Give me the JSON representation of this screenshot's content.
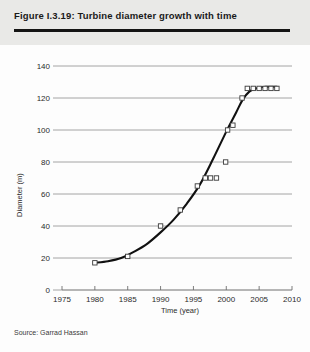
{
  "figure": {
    "title": "Figure I.3.19: Turbine diameter growth with time",
    "source": "Source: Garrad Hassan"
  },
  "colors": {
    "header_background": "#e9e9e7",
    "title_rule": "#141414",
    "gridline": "#8d8d8d",
    "axis": "#6f6f6f",
    "curve": "#111111",
    "marker_stroke": "#3a3a3a",
    "marker_fill": "#ffffff",
    "page_background": "#fdfdfd",
    "text": "#2b2b2b"
  },
  "chart_data": {
    "type": "scatter",
    "title": "Turbine diameter growth with time",
    "xlabel": "Time (year)",
    "ylabel": "Diameter (m)",
    "xlim": [
      1975,
      2010
    ],
    "ylim": [
      0,
      140
    ],
    "xticks": [
      1975,
      1980,
      1985,
      1990,
      1995,
      2000,
      2005,
      2010
    ],
    "yticks": [
      0,
      20,
      40,
      60,
      80,
      100,
      120,
      140
    ],
    "xtick_labels": [
      "1975",
      "1980",
      "1985",
      "1990",
      "1995",
      "2000",
      "2005",
      "2010"
    ],
    "ytick_labels": [
      "0",
      "20",
      "40",
      "60",
      "80",
      "100",
      "120",
      "140"
    ],
    "grid": "horizontal",
    "legend": "none",
    "marker_style": "open-square",
    "points": [
      {
        "x": 1980.0,
        "y": 17
      },
      {
        "x": 1985.0,
        "y": 21
      },
      {
        "x": 1990.0,
        "y": 40
      },
      {
        "x": 1993.0,
        "y": 50
      },
      {
        "x": 1995.6,
        "y": 65
      },
      {
        "x": 1996.8,
        "y": 70
      },
      {
        "x": 1997.6,
        "y": 70
      },
      {
        "x": 1998.5,
        "y": 70
      },
      {
        "x": 1999.9,
        "y": 80
      },
      {
        "x": 2000.2,
        "y": 100
      },
      {
        "x": 2001.0,
        "y": 103
      },
      {
        "x": 2002.4,
        "y": 120
      },
      {
        "x": 2003.2,
        "y": 126
      },
      {
        "x": 2004.1,
        "y": 126
      },
      {
        "x": 2005.0,
        "y": 126
      },
      {
        "x": 2005.9,
        "y": 126
      },
      {
        "x": 2006.8,
        "y": 126
      },
      {
        "x": 2007.7,
        "y": 126
      }
    ],
    "fit_curve": [
      {
        "x": 1980.0,
        "y": 17
      },
      {
        "x": 1982.0,
        "y": 18
      },
      {
        "x": 1984.0,
        "y": 20
      },
      {
        "x": 1986.0,
        "y": 24
      },
      {
        "x": 1988.0,
        "y": 29
      },
      {
        "x": 1990.0,
        "y": 36
      },
      {
        "x": 1992.0,
        "y": 44
      },
      {
        "x": 1994.0,
        "y": 54
      },
      {
        "x": 1996.0,
        "y": 66
      },
      {
        "x": 1998.0,
        "y": 82
      },
      {
        "x": 2000.0,
        "y": 99
      },
      {
        "x": 2001.5,
        "y": 111
      },
      {
        "x": 2002.5,
        "y": 119
      },
      {
        "x": 2003.5,
        "y": 124
      },
      {
        "x": 2004.5,
        "y": 126
      },
      {
        "x": 2006.0,
        "y": 127
      },
      {
        "x": 2007.7,
        "y": 127
      }
    ]
  }
}
